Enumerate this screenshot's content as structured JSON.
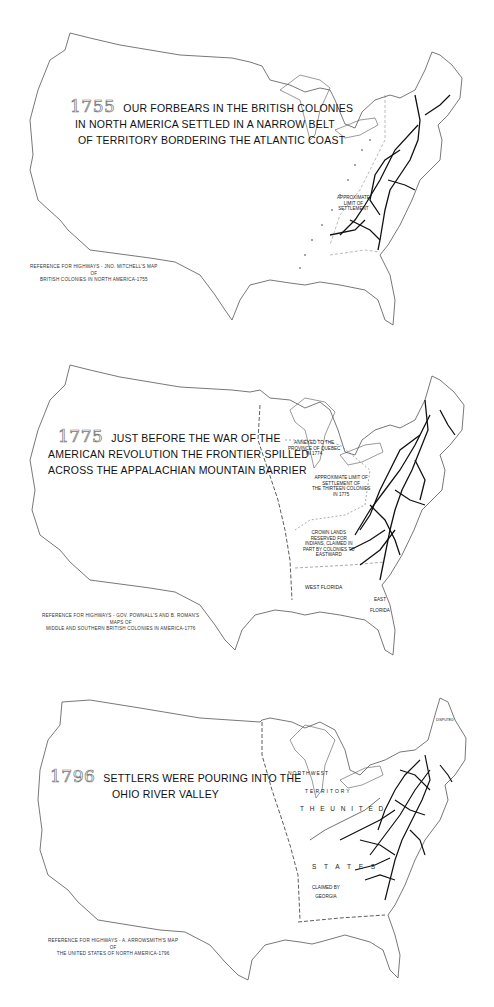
{
  "document": {
    "title": "Growth of American Settlement and Highways, 1755–1796",
    "colors": {
      "outline": "#555555",
      "roads": "#111111",
      "background": "#ffffff",
      "year_outline": "#777777"
    }
  },
  "maps": [
    {
      "year": "1755",
      "caption_lines": [
        "OUR FORBEARS IN THE BRITISH COLONIES",
        "IN NORTH AMERICA SETTLED IN A NARROW BELT",
        "OF TERRITORY BORDERING THE ATLANTIC COAST"
      ],
      "reference_lines": [
        "REFERENCE FOR HIGHWAYS - JNO. MITCHELL'S MAP",
        "OF",
        "BRITISH COLONIES IN NORTH AMERICA-1755"
      ],
      "labels": {
        "settlement_limit": [
          "APPROXIMATE",
          "LIMIT OF",
          "SETTLEMENT"
        ],
        "french": "F R E N C H",
        "possessions": "P O S S E S",
        "spanish": "S P A N I S H"
      }
    },
    {
      "year": "1775",
      "caption_lines": [
        "JUST BEFORE THE WAR OF THE",
        "AMERICAN REVOLUTION THE FRONTIER SPILLED",
        "ACROSS THE APPALACHIAN MOUNTAIN BARRIER"
      ],
      "reference_lines": [
        "REFERENCE FOR HIGHWAYS - GOV. POWNALL'S AND B. ROMAN'S",
        "MAPS OF",
        "MIDDLE AND SOUTHERN BRITISH COLONIES IN AMERICA-1776"
      ],
      "labels": {
        "quebec": [
          "ANNEXED TO THE",
          "PROVINCE OF QUEBEC",
          "IN 1774"
        ],
        "settlement_limit": [
          "APPROXIMATE LIMIT OF",
          "SETTLEMENT OF",
          "THE THIRTEEN COLONIES",
          "IN 1775"
        ],
        "crown_lands": [
          "CROWN LANDS",
          "RESERVED FOR",
          "INDIANS, CLAIMED IN",
          "PART BY COLONIES TO",
          "EASTWARD"
        ],
        "west_florida": "WEST FLORIDA",
        "east_florida": [
          "EAST",
          "FLORIDA"
        ],
        "louisiana_spanish": "L O U I S I A N A - S P A N I S H"
      }
    },
    {
      "year": "1796",
      "caption_lines": [
        "SETTLERS WERE POURING INTO THE",
        "OHIO RIVER VALLEY"
      ],
      "reference_lines": [
        "REFERENCE FOR HIGHWAYS - A. ARROWSMITH'S MAP",
        "OF",
        "THE UNITED STATES OF NORTH AMERICA-1796"
      ],
      "labels": {
        "northwest": "NORTHWEST",
        "territory": "TERRITORY",
        "the_united": "T H E   U N I T E D",
        "states": "S T A T E S",
        "ohio_river": "OHIO RIVER",
        "claimed_by_georgia": [
          "CLAIMED BY",
          "GEORGIA"
        ],
        "disputed": "DISPUTED",
        "louisiana_spanish": "L O U I S I A N A - S P A N I S H",
        "florida": "F L O R I D A"
      }
    }
  ]
}
